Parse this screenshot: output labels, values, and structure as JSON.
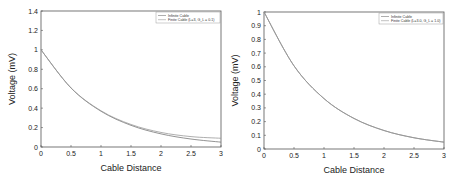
{
  "chart_data": [
    {
      "type": "line",
      "title": "",
      "xlabel": "Cable Distance",
      "ylabel": "Voltage (mV)",
      "xlim": [
        0,
        3
      ],
      "ylim": [
        0,
        1.4
      ],
      "xticks": [
        "0",
        "0.5",
        "1",
        "1.5",
        "2",
        "2.5",
        "3"
      ],
      "yticks": [
        "0",
        "0.2",
        "0.4",
        "0.6",
        "0.8",
        "1",
        "1.2",
        "1.4"
      ],
      "grid": false,
      "legend_position": "upper right",
      "x": [
        0,
        0.5,
        1,
        1.5,
        2,
        2.5,
        3
      ],
      "series": [
        {
          "name": "Infinite Cable",
          "values": [
            1.0,
            0.607,
            0.368,
            0.223,
            0.135,
            0.082,
            0.05
          ]
        },
        {
          "name": "Finite Cable (L=3, G_L = 0.1)",
          "values": [
            1.0,
            0.609,
            0.373,
            0.232,
            0.15,
            0.107,
            0.09
          ]
        }
      ]
    },
    {
      "type": "line",
      "title": "",
      "xlabel": "Cable Distance",
      "ylabel": "Voltage (mV)",
      "xlim": [
        0,
        3
      ],
      "ylim": [
        0,
        1
      ],
      "xticks": [
        "0",
        "0.5",
        "1",
        "1.5",
        "2",
        "2.5",
        "3"
      ],
      "yticks": [
        "0",
        "0.1",
        "0.2",
        "0.3",
        "0.4",
        "0.5",
        "0.6",
        "0.7",
        "0.8",
        "0.9",
        "1"
      ],
      "grid": false,
      "legend_position": "upper right",
      "x": [
        0,
        0.5,
        1,
        1.5,
        2,
        2.5,
        3
      ],
      "series": [
        {
          "name": "Infinite Cable",
          "values": [
            1.0,
            0.607,
            0.368,
            0.223,
            0.135,
            0.082,
            0.05
          ]
        },
        {
          "name": "Finite Cable (L=3.0, G_L = 1.0)",
          "values": [
            1.0,
            0.607,
            0.368,
            0.223,
            0.135,
            0.082,
            0.05
          ]
        }
      ]
    }
  ],
  "colors": {
    "axis": "#555555",
    "line1": "#777777",
    "line2": "#999999"
  }
}
